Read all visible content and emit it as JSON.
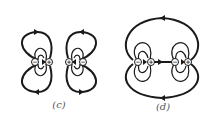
{
  "figure": {
    "panels": [
      {
        "id": "c",
        "label": "(c)",
        "description": "Two dipoles side by side with like (positive) ends facing; separate closed field-line loops around each dipole",
        "charges": [
          "−",
          "+",
          "+",
          "−"
        ]
      },
      {
        "id": "d",
        "label": "(d)",
        "description": "Two dipoles aligned head-to-tail; inner loops around each dipole plus large outer loops enclosing both",
        "charges": [
          "−",
          "+",
          "−",
          "+"
        ]
      }
    ]
  }
}
